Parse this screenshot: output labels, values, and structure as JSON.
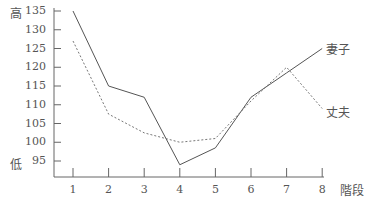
{
  "chart_data": {
    "type": "line",
    "title": "",
    "xlabel": "階段",
    "ylabel_top": "高",
    "ylabel_bottom": "低",
    "x": [
      1,
      2,
      3,
      4,
      5,
      6,
      7,
      8
    ],
    "x_tick_labels": [
      "1",
      "2",
      "3",
      "4",
      "5",
      "6",
      "7",
      "8"
    ],
    "y_tick_labels": [
      "135",
      "130",
      "125",
      "120",
      "115",
      "110",
      "105",
      "100",
      "95"
    ],
    "ylim": [
      91,
      135
    ],
    "grid": false,
    "legend_position": "inline-right",
    "series": [
      {
        "name": "妻子",
        "style": "solid",
        "color": "#555555",
        "values": [
          135,
          115,
          112,
          94,
          98.5,
          112,
          118.5,
          125
        ]
      },
      {
        "name": "丈夫",
        "style": "dashed",
        "color": "#777777",
        "values": [
          127,
          107.5,
          102.5,
          100,
          101,
          111,
          120,
          109
        ]
      }
    ]
  }
}
